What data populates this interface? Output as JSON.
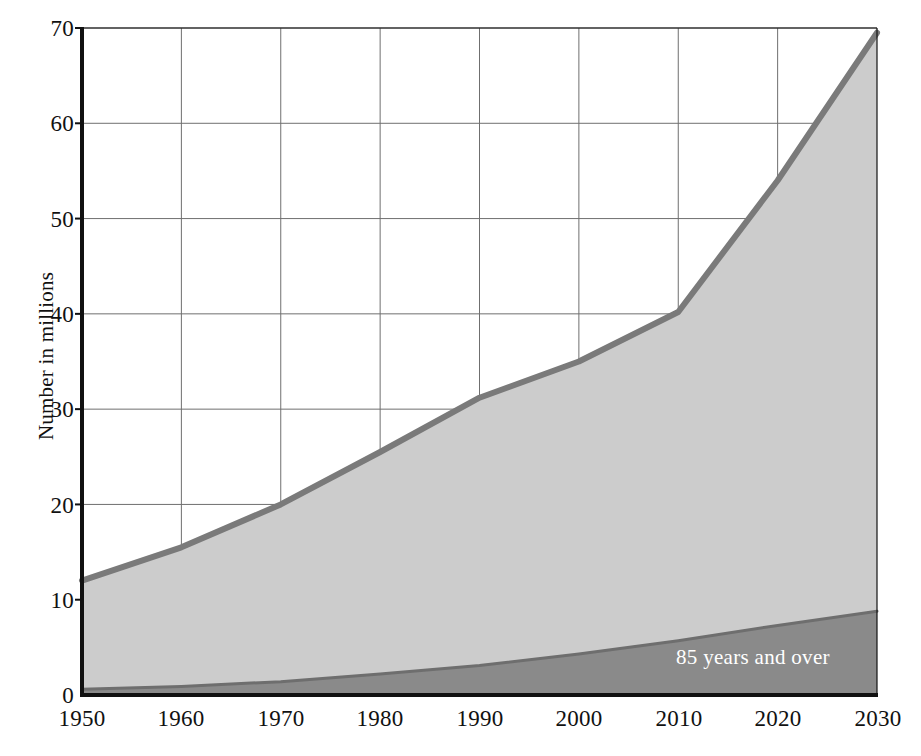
{
  "chart_data": {
    "type": "area",
    "title": "",
    "subtitle": "",
    "xlabel": "",
    "ylabel": "Number in millions",
    "x": [
      1950,
      1960,
      1970,
      1980,
      1990,
      2000,
      2010,
      2020,
      2030
    ],
    "xtick_labels": [
      "1950",
      "1960",
      "1970",
      "1980",
      "1990",
      "2000",
      "2010",
      "2020",
      "2030"
    ],
    "ytick_labels": [
      "0",
      "10",
      "20",
      "30",
      "40",
      "50",
      "60",
      "70"
    ],
    "ytick_values": [
      0,
      10,
      20,
      30,
      40,
      50,
      60,
      70
    ],
    "xlim": [
      1950,
      2030
    ],
    "ylim": [
      0,
      70
    ],
    "grid": true,
    "stacked": true,
    "legend_position": "inline-annotation",
    "series": [
      {
        "name": "85 years and over",
        "label": "85 years and over",
        "color": "#8a8a8a",
        "line_color": "#6e6e6e",
        "values": [
          0.6,
          0.9,
          1.4,
          2.2,
          3.1,
          4.3,
          5.7,
          7.3,
          8.8
        ]
      },
      {
        "name": "65 years and over (total)",
        "label": "",
        "color": "#cccccc",
        "line_color": "#7a7a7a",
        "values": [
          12.0,
          15.5,
          20.0,
          25.5,
          31.2,
          35.0,
          40.2,
          54.0,
          69.5
        ]
      }
    ],
    "annotations": [
      {
        "text": "85 years and over",
        "x": 2017,
        "y": 3.4,
        "color": "#ffffff"
      }
    ]
  },
  "axis": {
    "y_title": "Number in millions",
    "x_ticks": [
      "1950",
      "1960",
      "1970",
      "1980",
      "1990",
      "2000",
      "2010",
      "2020",
      "2030"
    ],
    "y_ticks": [
      "0",
      "10",
      "20",
      "30",
      "40",
      "50",
      "60",
      "70"
    ]
  },
  "colors": {
    "band_light": "#cccccc",
    "band_dark": "#8a8a8a",
    "line_light": "#7a7a7a",
    "line_dark": "#6e6e6e",
    "grid": "#6f6f6f",
    "axis": "#111111",
    "annotation_text": "#ffffff"
  }
}
